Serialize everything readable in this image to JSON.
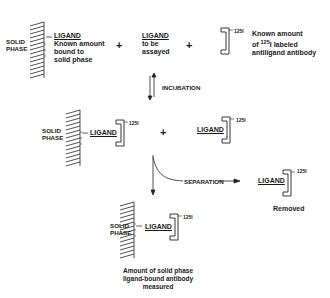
{
  "row1": {
    "solid_phase_label_1": "SOLID",
    "solid_phase_label_2": "PHASE",
    "ligand": "LIGAND",
    "desc_lines": [
      "Known amount",
      "bound to",
      "solid phase"
    ],
    "plus1": "+",
    "assay_ligand": "LIGAND",
    "assay_desc_lines": [
      "to be",
      "assayed"
    ],
    "plus2": "+",
    "label_125": "125",
    "antibody_desc_line1": "Known amount",
    "antibody_desc_line2_pre": "of ",
    "antibody_desc_line2_sup": "125",
    "antibody_desc_line2_post": "I labeled",
    "antibody_desc_line3": "antiligand antibody"
  },
  "incubation": {
    "label": "INCUBATION"
  },
  "row2": {
    "solid_phase_label_1": "SOLID",
    "solid_phase_label_2": "PHASE",
    "ligand_bound": "LIGAND",
    "label_125_a": "125",
    "plus": "+",
    "ligand_free": "LIGAND",
    "label_125_b": "125"
  },
  "separation": {
    "label": "SEPARATION",
    "removed_ligand": "LIGAND",
    "label_125": "125",
    "removed_caption": "Removed"
  },
  "row3": {
    "solid_phase_label_1": "SOLID",
    "solid_phase_label_2": "PHASE",
    "ligand": "LIGAND",
    "label_125": "125",
    "caption_lines": [
      "Amount of solid phase",
      "ligand-bound antibody",
      "measured"
    ]
  }
}
